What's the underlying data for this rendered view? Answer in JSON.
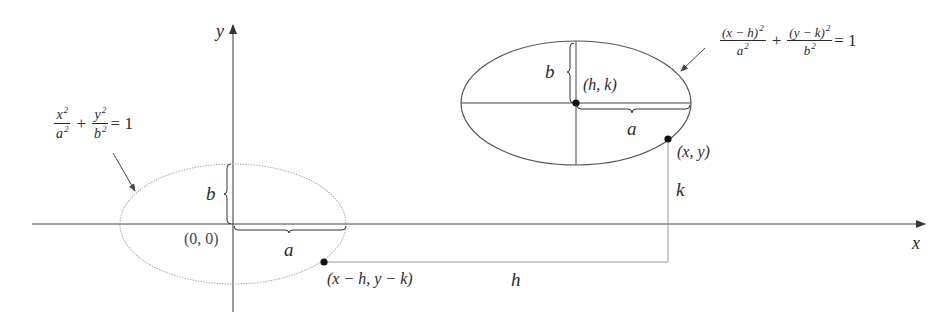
{
  "figure": {
    "type": "ellipse-translation-diagram",
    "axes": {
      "x_label": "x",
      "y_label": "y"
    },
    "origin_label": "(0, 0)",
    "standard_ellipse": {
      "equation": {
        "term1_num": "x",
        "term1_den": "a",
        "term2_num": "y",
        "term2_den": "b",
        "exp": "2",
        "plus": "+",
        "equals": "= 1"
      },
      "semi_major_label": "a",
      "semi_minor_label": "b",
      "style": "dotted",
      "color": "#b0b0b0"
    },
    "translated_ellipse": {
      "equation": {
        "term1_num": "(x − h)",
        "term1_den": "a",
        "term2_num": "(y − k)",
        "term2_den": "b",
        "exp": "2",
        "plus": "+",
        "equals": "= 1"
      },
      "center_label": "(h, k)",
      "semi_major_label": "a",
      "semi_minor_label": "b",
      "style": "solid",
      "color": "#555555"
    },
    "points": {
      "original_point_label": "(x − h, y − k)",
      "translated_point_label": "(x, y)"
    },
    "shift_labels": {
      "horizontal": "h",
      "vertical": "k"
    },
    "colors": {
      "axis": "#444444",
      "ink": "#2a2a2a",
      "connector": "#9a9a9a"
    }
  }
}
